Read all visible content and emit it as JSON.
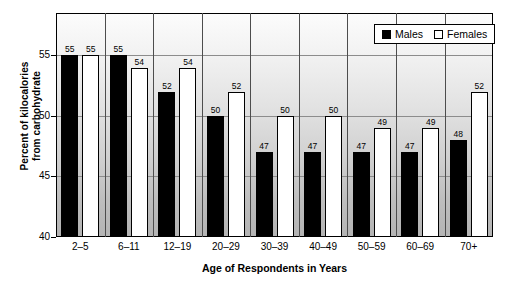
{
  "chart_data": {
    "type": "bar",
    "title": "",
    "xlabel": "Age of Respondents in Years",
    "ylabel": "Percent of kilocalories from carbohydrate",
    "ylabel_line1": "Percent of kilocalories",
    "ylabel_line2": "from carbohydrate",
    "categories": [
      "2–5",
      "6–11",
      "12–19",
      "20–29",
      "30–39",
      "40–49",
      "50–59",
      "60–69",
      "70+"
    ],
    "series": [
      {
        "name": "Males",
        "color": "#000000",
        "values": [
          55,
          55,
          52,
          50,
          47,
          47,
          47,
          47,
          48
        ]
      },
      {
        "name": "Females",
        "color": "#ffffff",
        "values": [
          55,
          54,
          54,
          52,
          50,
          50,
          49,
          49,
          52
        ]
      }
    ],
    "ylim": [
      40,
      58.5
    ],
    "yticks": [
      40,
      45,
      50,
      55
    ],
    "ytick_labels": [
      "40",
      "45",
      "50",
      "55"
    ],
    "gridlines": [
      45,
      50,
      55
    ],
    "grid": true,
    "legend_position": "top-right",
    "data_labels": true
  },
  "legend": {
    "items": [
      {
        "label": "Males",
        "swatch": "filled-square-black"
      },
      {
        "label": "Females",
        "swatch": "empty-square-white"
      }
    ]
  }
}
